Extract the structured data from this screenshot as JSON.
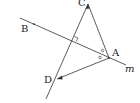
{
  "diagram": {
    "labels": {
      "A": "A",
      "B": "B",
      "C": "C",
      "D": "D",
      "m": "m"
    },
    "colors": {
      "stroke": "#333333",
      "background": "#ffffff"
    },
    "elements": {
      "line_m": "line m through B and A",
      "segment_CA": "segment C to A",
      "line_CD": "line through C and D, perpendicular to m",
      "segment_AD": "segment A to D",
      "right_angle_marker": "right angle at intersection of CD and m",
      "equal_angle_marks": "two small circles marking equal angles at A"
    }
  }
}
